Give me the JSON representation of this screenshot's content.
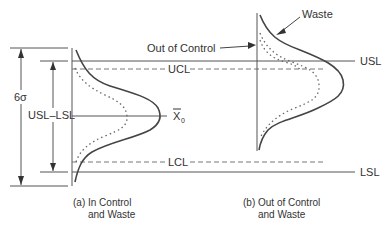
{
  "diagram": {
    "colors": {
      "ink": "#444444",
      "light": "#777777",
      "background": "#ffffff"
    },
    "labels": {
      "six_sigma": "6σ",
      "usl_minus_lsl": "USL–LSL",
      "ucl": "UCL",
      "lcl": "LCL",
      "usl": "USL",
      "lsl": "LSL",
      "x0_main": "X",
      "x0_sub": "0",
      "out_of_control": "Out of Control",
      "waste": "Waste"
    },
    "captions": {
      "a_line1": "(a) In Control",
      "a_line2": "and Waste",
      "b_line1": "(b) Out of Control",
      "b_line2": "and Waste"
    }
  }
}
